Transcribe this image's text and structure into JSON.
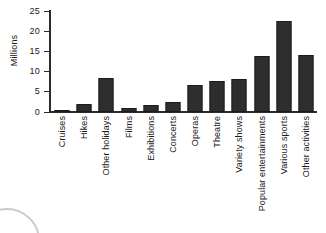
{
  "chart_data": {
    "type": "bar",
    "title": "",
    "xlabel": "",
    "ylabel": "Millions",
    "ylim": [
      0,
      25
    ],
    "yticks": [
      0,
      5,
      10,
      15,
      20,
      25
    ],
    "grid": false,
    "legend": null,
    "bar_color": "#2e2e2e",
    "categories": [
      "Cruises",
      "Hikes",
      "Other holidays",
      "Films",
      "Exhibitions",
      "Concerts",
      "Operas",
      "Theatre",
      "Variety shows",
      "Popular entertainments",
      "Various sports",
      "Other activities"
    ],
    "values": [
      0.3,
      2.0,
      8.4,
      0.9,
      1.7,
      2.6,
      6.8,
      7.7,
      8.2,
      13.8,
      22.6,
      14.0
    ]
  },
  "axis": {
    "y_title": "Millions",
    "tick_labels": [
      "0",
      "5",
      "10",
      "15",
      "20",
      "25"
    ]
  }
}
